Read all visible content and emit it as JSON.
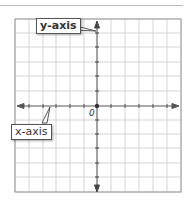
{
  "diagram": {
    "type": "coordinate-plane",
    "labels": {
      "y_axis": "y-axis",
      "x_axis": "x-axis",
      "origin": "0"
    },
    "grid": {
      "columns": 12,
      "rows": 12,
      "cell_px": 14
    },
    "colors": {
      "grid": "#c8c8c8",
      "axis": "#444444",
      "border": "#999999"
    }
  }
}
